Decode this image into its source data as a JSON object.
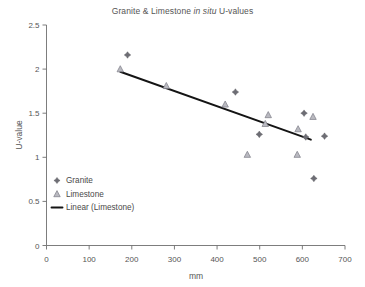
{
  "chart_data": {
    "type": "scatter",
    "title": "Granite & Limestone in situ U-values",
    "title_plain": "Granite & Limestone ",
    "title_italic": "in situ",
    "title_tail": " U-values",
    "xlabel": "mm",
    "ylabel": "U-value",
    "xlim": [
      0,
      700
    ],
    "ylim": [
      0,
      2.5
    ],
    "xticks": [
      0,
      100,
      200,
      300,
      400,
      500,
      600,
      700
    ],
    "yticks": [
      0,
      0.5,
      1,
      1.5,
      2,
      2.5
    ],
    "xtick_labels": [
      "0",
      "100",
      "200",
      "300",
      "400",
      "500",
      "600",
      "700"
    ],
    "ytick_labels": [
      "0",
      "0.5",
      "1",
      "1.5",
      "2",
      "2.5"
    ],
    "grid": false,
    "legend_position": "inside-lower-left",
    "series": [
      {
        "name": "Granite",
        "marker": "diamond",
        "color": "#6d6d74",
        "points": [
          {
            "x": 190,
            "y": 2.16
          },
          {
            "x": 443,
            "y": 1.74
          },
          {
            "x": 499,
            "y": 1.26
          },
          {
            "x": 604,
            "y": 1.5
          },
          {
            "x": 608,
            "y": 1.23
          },
          {
            "x": 652,
            "y": 1.24
          },
          {
            "x": 627,
            "y": 0.76
          }
        ]
      },
      {
        "name": "Limestone",
        "marker": "triangle",
        "color": "#b9b9c0",
        "points": [
          {
            "x": 173,
            "y": 2.0
          },
          {
            "x": 281,
            "y": 1.81
          },
          {
            "x": 419,
            "y": 1.6
          },
          {
            "x": 471,
            "y": 1.03
          },
          {
            "x": 513,
            "y": 1.38
          },
          {
            "x": 520,
            "y": 1.48
          },
          {
            "x": 588,
            "y": 1.03
          },
          {
            "x": 590,
            "y": 1.32
          },
          {
            "x": 625,
            "y": 1.46
          }
        ]
      }
    ],
    "trendline": {
      "name": "Linear (Limestone)",
      "color": "#141414",
      "x_start": 173,
      "y_start": 1.97,
      "x_end": 620,
      "y_end": 1.2
    },
    "legend_entries": [
      {
        "label": "Granite",
        "marker": "diamond"
      },
      {
        "label": "Limestone",
        "marker": "triangle"
      },
      {
        "label": "Linear (Limestone)",
        "marker": "line"
      }
    ]
  }
}
